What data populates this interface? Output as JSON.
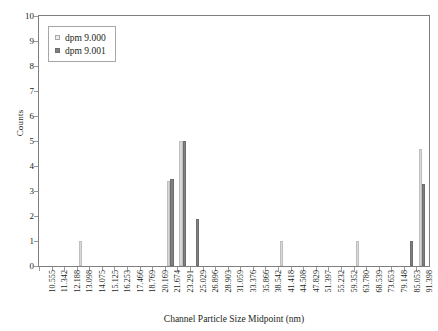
{
  "chart_data": {
    "type": "bar",
    "title": "",
    "xlabel": "Channel Particle Size Midpoint (nm)",
    "ylabel": "Counts",
    "ylim": [
      0,
      10
    ],
    "ytick_step": 1,
    "yticks": [
      "0",
      "1",
      "2",
      "3",
      "4",
      "5",
      "6",
      "7",
      "8",
      "9",
      "10"
    ],
    "grid": false,
    "legend_position": "top-left",
    "categories": [
      "10.555",
      "11.342",
      "12.188",
      "13.098",
      "14.075",
      "15.125",
      "16.253",
      "17.466",
      "18.769",
      "20.169",
      "21.674",
      "23.291",
      "25.029",
      "26.896",
      "28.903",
      "31.059",
      "33.376",
      "35.866",
      "38.542",
      "41.418",
      "44.508",
      "47.829",
      "51.397",
      "55.232",
      "59.352",
      "63.780",
      "68.539",
      "73.653",
      "79.148",
      "85.053",
      "91.398"
    ],
    "series": [
      {
        "name": "dpm 9.000",
        "color": "#d9d9d9",
        "values": [
          0,
          0,
          0,
          1,
          0,
          0,
          0,
          0,
          0,
          0,
          3.4,
          5,
          0,
          0,
          0,
          0,
          0,
          0,
          0,
          1,
          0,
          0,
          0,
          0,
          0,
          1,
          0,
          0,
          0,
          0,
          4.7
        ]
      },
      {
        "name": "dpm 9.001",
        "color": "#808080",
        "values": [
          0,
          0,
          0,
          0,
          0,
          0,
          0,
          0,
          0,
          0,
          3.5,
          5,
          1.9,
          0,
          0,
          0,
          0,
          0,
          0,
          0,
          0,
          0,
          0,
          0,
          0,
          0,
          0,
          0,
          0,
          1,
          3.3
        ]
      }
    ]
  },
  "legend": {
    "entries": [
      {
        "label": "dpm 9.000",
        "marker": "square-light"
      },
      {
        "label": "dpm 9.001",
        "marker": "square-dark"
      }
    ]
  },
  "colors": {
    "series_a": "#d9d9d9",
    "series_b": "#808080",
    "axis": "#7f7f7f",
    "text": "#231f20",
    "background": "#ffffff"
  }
}
